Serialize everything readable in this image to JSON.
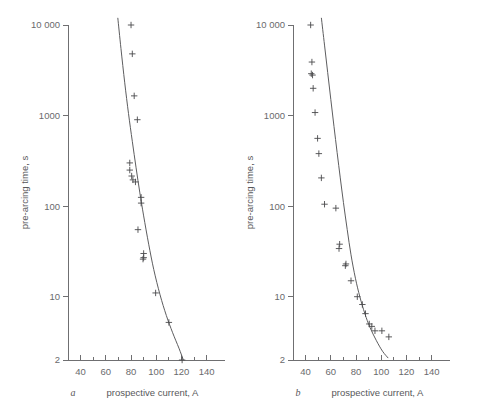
{
  "figure": {
    "background_color": "#ffffff",
    "ink_color": "#58585a",
    "width": 477,
    "height": 412
  },
  "chart_data": [
    {
      "type": "scatter",
      "panel": "a",
      "panel_label": "a",
      "title": "",
      "xlabel": "prospective current, A",
      "ylabel": "pre-arcing time, s",
      "xlim": [
        30,
        145
      ],
      "ylim": [
        2,
        10000
      ],
      "yscale": "log",
      "xscale": "linear",
      "grid": false,
      "legend": "none",
      "xticks": [
        40,
        60,
        80,
        100,
        120,
        140
      ],
      "xticklabels": [
        "40",
        "60",
        "80",
        "100",
        "120",
        "140"
      ],
      "xminorticks": [
        30,
        50,
        70,
        90,
        110,
        130
      ],
      "yticks": [
        2,
        10,
        100,
        1000,
        10000
      ],
      "yticklabels": [
        "2",
        "10",
        "100",
        "1000",
        "10 000"
      ],
      "marker": "plus",
      "points": [
        {
          "x": 80.0,
          "y": 10000
        },
        {
          "x": 81.0,
          "y": 4800
        },
        {
          "x": 82.5,
          "y": 1650
        },
        {
          "x": 85.0,
          "y": 900
        },
        {
          "x": 79.0,
          "y": 300
        },
        {
          "x": 79.0,
          "y": 250
        },
        {
          "x": 80.5,
          "y": 215
        },
        {
          "x": 81.5,
          "y": 195
        },
        {
          "x": 83.5,
          "y": 185
        },
        {
          "x": 88.0,
          "y": 125
        },
        {
          "x": 88.0,
          "y": 108
        },
        {
          "x": 85.5,
          "y": 55
        },
        {
          "x": 90.0,
          "y": 30
        },
        {
          "x": 90.0,
          "y": 27
        },
        {
          "x": 89.5,
          "y": 26
        },
        {
          "x": 99.5,
          "y": 11
        },
        {
          "x": 110.0,
          "y": 5.2
        },
        {
          "x": 120.5,
          "y": 2.0
        }
      ],
      "curve": {
        "description": "fitted pre-arcing time characteristic",
        "points": [
          {
            "x": 69.5,
            "y": 12000
          },
          {
            "x": 72.0,
            "y": 5500
          },
          {
            "x": 75.0,
            "y": 2300
          },
          {
            "x": 78.0,
            "y": 1050
          },
          {
            "x": 81.0,
            "y": 520
          },
          {
            "x": 84.0,
            "y": 265
          },
          {
            "x": 87.0,
            "y": 140
          },
          {
            "x": 90.0,
            "y": 78
          },
          {
            "x": 94.0,
            "y": 38
          },
          {
            "x": 98.0,
            "y": 20
          },
          {
            "x": 103.0,
            "y": 10.5
          },
          {
            "x": 108.0,
            "y": 6.2
          },
          {
            "x": 113.0,
            "y": 4.0
          },
          {
            "x": 118.0,
            "y": 2.7
          },
          {
            "x": 121.5,
            "y": 2.0
          }
        ]
      }
    },
    {
      "type": "scatter",
      "panel": "b",
      "panel_label": "b",
      "title": "",
      "xlabel": "prospective current, A",
      "ylabel": "pre-arcing time, s",
      "xlim": [
        30,
        145
      ],
      "ylim": [
        2,
        10000
      ],
      "yscale": "log",
      "xscale": "linear",
      "grid": false,
      "legend": "none",
      "xticks": [
        40,
        60,
        80,
        100,
        120,
        140
      ],
      "xticklabels": [
        "40",
        "60",
        "80",
        "100",
        "120",
        "140"
      ],
      "xminorticks": [
        30,
        50,
        70,
        90,
        110,
        130
      ],
      "yticks": [
        2,
        10,
        100,
        1000,
        10000
      ],
      "yticklabels": [
        "2",
        "10",
        "100",
        "1000",
        "10 000"
      ],
      "marker": "plus",
      "points": [
        {
          "x": 44.0,
          "y": 10000
        },
        {
          "x": 45.0,
          "y": 3900
        },
        {
          "x": 44.5,
          "y": 2900
        },
        {
          "x": 45.5,
          "y": 2800
        },
        {
          "x": 46.0,
          "y": 2000
        },
        {
          "x": 47.5,
          "y": 1080
        },
        {
          "x": 49.5,
          "y": 560
        },
        {
          "x": 50.5,
          "y": 380
        },
        {
          "x": 52.5,
          "y": 205
        },
        {
          "x": 55.0,
          "y": 105
        },
        {
          "x": 64.0,
          "y": 95
        },
        {
          "x": 67.0,
          "y": 38
        },
        {
          "x": 66.5,
          "y": 34
        },
        {
          "x": 72.0,
          "y": 23
        },
        {
          "x": 71.5,
          "y": 22
        },
        {
          "x": 76.0,
          "y": 15
        },
        {
          "x": 81.0,
          "y": 10
        },
        {
          "x": 85.0,
          "y": 8.2
        },
        {
          "x": 87.5,
          "y": 6.5
        },
        {
          "x": 90.5,
          "y": 5.0
        },
        {
          "x": 92.5,
          "y": 4.7
        },
        {
          "x": 95.0,
          "y": 4.2
        },
        {
          "x": 100.5,
          "y": 4.2
        },
        {
          "x": 106.0,
          "y": 3.6
        }
      ],
      "curve": {
        "description": "fitted pre-arcing time characteristic",
        "points": [
          {
            "x": 52.5,
            "y": 12000
          },
          {
            "x": 55.0,
            "y": 6000
          },
          {
            "x": 57.5,
            "y": 3000
          },
          {
            "x": 60.0,
            "y": 1500
          },
          {
            "x": 62.5,
            "y": 760
          },
          {
            "x": 65.0,
            "y": 390
          },
          {
            "x": 67.5,
            "y": 205
          },
          {
            "x": 70.0,
            "y": 110
          },
          {
            "x": 73.0,
            "y": 55
          },
          {
            "x": 76.0,
            "y": 29
          },
          {
            "x": 79.5,
            "y": 16
          },
          {
            "x": 83.0,
            "y": 10
          },
          {
            "x": 87.0,
            "y": 6.5
          },
          {
            "x": 91.0,
            "y": 4.6
          },
          {
            "x": 96.0,
            "y": 3.3
          },
          {
            "x": 101.0,
            "y": 2.5
          },
          {
            "x": 105.5,
            "y": 2.1
          }
        ]
      }
    }
  ]
}
